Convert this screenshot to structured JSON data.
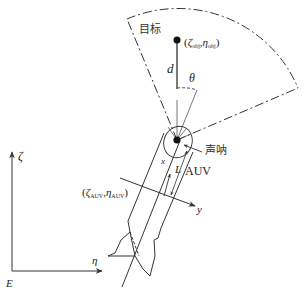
{
  "diagram": {
    "labels": {
      "target": "目标",
      "sonar": "声呐",
      "auv": "AUV",
      "distance": "d",
      "angle": "θ",
      "length": "L",
      "body_x": "x",
      "body_y": "y",
      "axis_zeta": "ζ",
      "axis_eta": "η",
      "origin": "E"
    },
    "target_coord": {
      "open": "(",
      "zeta": "ζ",
      "zeta_sub": "obj",
      "sep": ",",
      "eta": "η",
      "eta_sub": "obj",
      "close": ")"
    },
    "auv_coord": {
      "open": "(",
      "zeta": "ζ",
      "zeta_sub": "AUV",
      "sep": ",",
      "eta": "η",
      "eta_sub": "AUV",
      "close": ")"
    },
    "colors": {
      "line": "#222222",
      "background": "#ffffff"
    }
  }
}
